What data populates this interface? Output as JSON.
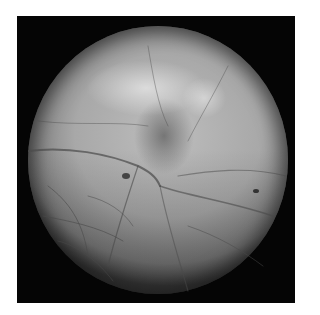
{
  "image": {
    "subject": "retinal fundus photograph",
    "alt": "Grayscale fundus image showing retinal vasculature with a dark lesion near the center",
    "colors": {
      "background": "#ffffff",
      "frame": "#050505",
      "fundus_light": "#bdbdbd",
      "fundus_mid": "#a8a8a8",
      "fundus_edge": "#3a3a3a",
      "vessel": "#4a4a4a"
    }
  }
}
